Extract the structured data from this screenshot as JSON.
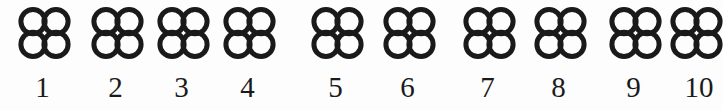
{
  "figure": {
    "background_color": "#fdfdfd",
    "ink_color": "#1a1a1a",
    "symbol": {
      "name": "quatrefoil-four-circles",
      "circle_count": 4,
      "arrangement": "2x2",
      "stroke_color": "#1a1a1a",
      "stroke_width_px": 5,
      "fill": "none"
    },
    "items": [
      {
        "index": "1",
        "x": 16,
        "label_x": 16,
        "group": 1
      },
      {
        "index": "2",
        "x": 89,
        "label_x": 89,
        "group": 1
      },
      {
        "index": "3",
        "x": 155,
        "label_x": 155,
        "group": 1
      },
      {
        "index": "4",
        "x": 221,
        "label_x": 221,
        "group": 1
      },
      {
        "index": "5",
        "x": 309,
        "label_x": 309,
        "group": 2
      },
      {
        "index": "6",
        "x": 381,
        "label_x": 381,
        "group": 2
      },
      {
        "index": "7",
        "x": 461,
        "label_x": 461,
        "group": 3
      },
      {
        "index": "8",
        "x": 532,
        "label_x": 532,
        "group": 3
      },
      {
        "index": "9",
        "x": 607,
        "label_x": 607,
        "group": 4
      },
      {
        "index": "10",
        "x": 668,
        "label_x": 668,
        "group": 4
      }
    ]
  }
}
